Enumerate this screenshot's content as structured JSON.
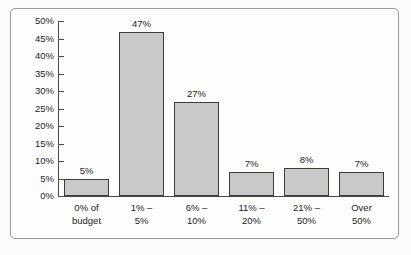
{
  "chart_data": {
    "type": "bar",
    "title": "",
    "subtitle": "",
    "xlabel": "",
    "ylabel": "",
    "categories": [
      "0% of budget",
      "1% – 5%",
      "6% – 10%",
      "11% – 20%",
      "21% – 50%",
      "Over 50%"
    ],
    "category_lines": [
      [
        "0% of",
        "budget"
      ],
      [
        "1% –",
        "5%"
      ],
      [
        "6% –",
        "10%"
      ],
      [
        "11% –",
        "20%"
      ],
      [
        "21% –",
        "50%"
      ],
      [
        "Over",
        "50%"
      ]
    ],
    "values": [
      5,
      47,
      27,
      7,
      8,
      7
    ],
    "data_labels": [
      "5%",
      "47%",
      "27%",
      "7%",
      "8%",
      "7%"
    ],
    "ylim": [
      0,
      50
    ],
    "ytick_values": [
      0,
      5,
      10,
      15,
      20,
      25,
      30,
      35,
      40,
      45,
      50
    ],
    "ytick_labels": [
      "0%",
      "5%",
      "10%",
      "15%",
      "20%",
      "25%",
      "30%",
      "35%",
      "40%",
      "45%",
      "50%"
    ],
    "grid": false,
    "legend": null,
    "legend_position": "none",
    "colors": {
      "bar_fill": "#c9c9c9",
      "bar_border": "#3b3b3b",
      "axis": "#4a4a4a",
      "text": "#1c1c1c",
      "background": "#fdfdfc",
      "frame_border": "#9a9a9a"
    }
  }
}
